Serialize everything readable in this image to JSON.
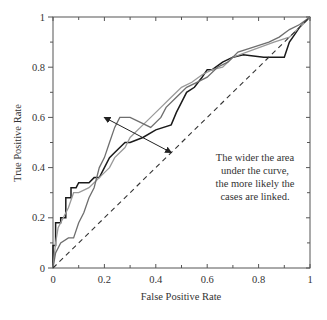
{
  "chart_data": {
    "type": "line",
    "title": "",
    "xlabel": "False Positive Rate",
    "ylabel": "True Positive Rate",
    "xlim": [
      0,
      1
    ],
    "ylim": [
      0,
      1
    ],
    "grid": false,
    "legend": "none",
    "x_ticks": [
      "0",
      "0.2",
      "0.4",
      "0.6",
      "0.8",
      "1"
    ],
    "y_ticks": [
      "0",
      "0.2",
      "0.4",
      "0.6",
      "0.8",
      "1"
    ],
    "annotation": {
      "lines": [
        "The wider the area",
        "under the curve,",
        "the more likely the",
        "cases are linked."
      ],
      "arrow_from": [
        0.2,
        0.6
      ],
      "arrow_to": [
        0.46,
        0.46
      ]
    },
    "series": [
      {
        "name": "black curve",
        "color": "#1a1a1a",
        "x": [
          0,
          0,
          0.01,
          0.01,
          0.03,
          0.03,
          0.05,
          0.05,
          0.07,
          0.07,
          0.09,
          0.1,
          0.14,
          0.16,
          0.18,
          0.2,
          0.22,
          0.24,
          0.28,
          0.3,
          0.35,
          0.4,
          0.46,
          0.48,
          0.5,
          0.52,
          0.55,
          0.58,
          0.6,
          0.62,
          0.66,
          0.7,
          0.74,
          0.82,
          0.9,
          0.92,
          0.94,
          0.96,
          1
        ],
        "y": [
          0,
          0.09,
          0.09,
          0.18,
          0.18,
          0.2,
          0.2,
          0.28,
          0.28,
          0.32,
          0.32,
          0.34,
          0.34,
          0.36,
          0.36,
          0.4,
          0.44,
          0.46,
          0.5,
          0.5,
          0.52,
          0.55,
          0.57,
          0.62,
          0.66,
          0.7,
          0.72,
          0.76,
          0.79,
          0.79,
          0.82,
          0.84,
          0.85,
          0.84,
          0.84,
          0.9,
          0.93,
          0.96,
          1
        ]
      },
      {
        "name": "light gray curve",
        "color": "#9a9a9a",
        "x": [
          0,
          0.01,
          0.02,
          0.04,
          0.06,
          0.08,
          0.1,
          0.14,
          0.16,
          0.18,
          0.2,
          0.22,
          0.24,
          0.28,
          0.3,
          0.34,
          0.38,
          0.42,
          0.46,
          0.5,
          0.54,
          0.58,
          0.62,
          0.66,
          0.7,
          0.78,
          0.86,
          0.92,
          0.96,
          1
        ],
        "y": [
          0,
          0.1,
          0.16,
          0.2,
          0.24,
          0.3,
          0.3,
          0.32,
          0.34,
          0.36,
          0.38,
          0.4,
          0.44,
          0.48,
          0.52,
          0.56,
          0.6,
          0.64,
          0.68,
          0.72,
          0.74,
          0.77,
          0.79,
          0.8,
          0.84,
          0.87,
          0.9,
          0.92,
          0.96,
          1
        ]
      },
      {
        "name": "gray curve",
        "color": "#6e6e6e",
        "x": [
          0,
          0.01,
          0.03,
          0.06,
          0.08,
          0.1,
          0.12,
          0.14,
          0.16,
          0.18,
          0.2,
          0.22,
          0.24,
          0.26,
          0.3,
          0.34,
          0.38,
          0.42,
          0.44,
          0.48,
          0.52,
          0.56,
          0.6,
          0.64,
          0.68,
          0.72,
          0.78,
          0.84,
          0.88,
          0.92,
          0.96,
          1
        ],
        "y": [
          0,
          0.06,
          0.1,
          0.12,
          0.12,
          0.18,
          0.22,
          0.28,
          0.32,
          0.4,
          0.44,
          0.5,
          0.56,
          0.6,
          0.6,
          0.58,
          0.56,
          0.6,
          0.64,
          0.68,
          0.72,
          0.74,
          0.76,
          0.8,
          0.82,
          0.86,
          0.88,
          0.9,
          0.92,
          0.95,
          0.97,
          1
        ]
      },
      {
        "name": "random classifier (diagonal)",
        "color": "#333333",
        "dash": true,
        "x": [
          0,
          1
        ],
        "y": [
          0,
          1
        ]
      }
    ]
  }
}
